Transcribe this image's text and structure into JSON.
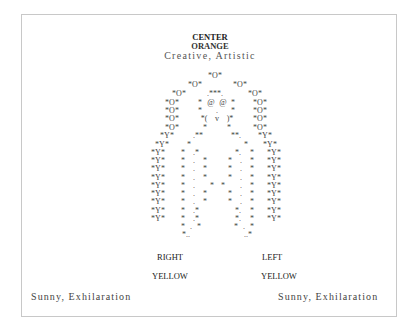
{
  "header": {
    "position": "CENTER",
    "color": "ORANGE",
    "traits": "Creative, Artistic"
  },
  "ascii_art": {
    "description": "Figure drawn in text characters: head ring of *O* tokens, face with @ @ eyes and ( v ) mouth, body and arms ring of *Y* tokens",
    "rows": [
      {
        "y": 72,
        "tokens": [
          {
            "x": 215,
            "t": "*O*"
          }
        ]
      },
      {
        "y": 81,
        "tokens": [
          {
            "x": 195,
            "t": "*O*"
          },
          {
            "x": 240,
            "t": "*O*"
          }
        ]
      },
      {
        "y": 90,
        "tokens": [
          {
            "x": 179,
            "t": "*O*"
          },
          {
            "x": 215,
            "t": ".***."
          },
          {
            "x": 255,
            "t": "*O*"
          }
        ]
      },
      {
        "y": 99,
        "tokens": [
          {
            "x": 172,
            "t": "*O*"
          },
          {
            "x": 200,
            "t": "*"
          },
          {
            "x": 211,
            "t": "@"
          },
          {
            "x": 223,
            "t": "@"
          },
          {
            "x": 233,
            "t": "*"
          },
          {
            "x": 260,
            "t": "*O*"
          }
        ]
      },
      {
        "y": 107,
        "tokens": [
          {
            "x": 172,
            "t": "*O*"
          },
          {
            "x": 200,
            "t": "*"
          },
          {
            "x": 217,
            "t": "."
          },
          {
            "x": 233,
            "t": "*"
          },
          {
            "x": 260,
            "t": "*O*"
          }
        ]
      },
      {
        "y": 115,
        "tokens": [
          {
            "x": 172,
            "t": "*O*"
          },
          {
            "x": 204,
            "t": "*("
          },
          {
            "x": 217,
            "t": "v"
          },
          {
            "x": 230,
            "t": ")*"
          },
          {
            "x": 260,
            "t": "*O*"
          }
        ]
      },
      {
        "y": 124,
        "tokens": [
          {
            "x": 172,
            "t": "*O*"
          },
          {
            "x": 205,
            "t": "*"
          },
          {
            "x": 229,
            "t": "*"
          },
          {
            "x": 260,
            "t": "*O*"
          }
        ]
      },
      {
        "y": 132,
        "tokens": [
          {
            "x": 167,
            "t": "*Y*"
          },
          {
            "x": 198,
            "t": ".**"
          },
          {
            "x": 236,
            "t": "**."
          },
          {
            "x": 265,
            "t": "*Y*"
          }
        ]
      },
      {
        "y": 141,
        "tokens": [
          {
            "x": 162,
            "t": "*Y*"
          },
          {
            "x": 189,
            "t": "*"
          },
          {
            "x": 246,
            "t": "*"
          },
          {
            "x": 270,
            "t": "*Y*"
          }
        ]
      },
      {
        "y": 149,
        "tokens": [
          {
            "x": 158,
            "t": "*Y*"
          },
          {
            "x": 183,
            "t": "*"
          },
          {
            "x": 196,
            "t": ".*"
          },
          {
            "x": 238,
            "t": "*."
          },
          {
            "x": 252,
            "t": "*"
          },
          {
            "x": 274,
            "t": "*Y*"
          }
        ]
      },
      {
        "y": 157,
        "tokens": [
          {
            "x": 158,
            "t": "*Y*"
          },
          {
            "x": 183,
            "t": "*"
          },
          {
            "x": 194,
            "t": "."
          },
          {
            "x": 205,
            "t": "*"
          },
          {
            "x": 230,
            "t": "*"
          },
          {
            "x": 241,
            "t": "."
          },
          {
            "x": 252,
            "t": "*"
          },
          {
            "x": 274,
            "t": "*Y*"
          }
        ]
      },
      {
        "y": 165,
        "tokens": [
          {
            "x": 158,
            "t": "*Y*"
          },
          {
            "x": 183,
            "t": "*"
          },
          {
            "x": 194,
            "t": "."
          },
          {
            "x": 205,
            "t": "*"
          },
          {
            "x": 230,
            "t": "*"
          },
          {
            "x": 241,
            "t": "."
          },
          {
            "x": 252,
            "t": "*"
          },
          {
            "x": 274,
            "t": "*Y*"
          }
        ]
      },
      {
        "y": 174,
        "tokens": [
          {
            "x": 158,
            "t": "*Y*"
          },
          {
            "x": 183,
            "t": "*"
          },
          {
            "x": 194,
            "t": "."
          },
          {
            "x": 205,
            "t": "*"
          },
          {
            "x": 230,
            "t": "*"
          },
          {
            "x": 241,
            "t": "."
          },
          {
            "x": 252,
            "t": "*"
          },
          {
            "x": 274,
            "t": "*Y*"
          }
        ]
      },
      {
        "y": 182,
        "tokens": [
          {
            "x": 158,
            "t": "*Y*"
          },
          {
            "x": 183,
            "t": "*"
          },
          {
            "x": 194,
            "t": "."
          },
          {
            "x": 212,
            "t": "*"
          },
          {
            "x": 223,
            "t": "*"
          },
          {
            "x": 241,
            "t": "."
          },
          {
            "x": 252,
            "t": "*"
          },
          {
            "x": 274,
            "t": "*Y*"
          }
        ]
      },
      {
        "y": 190,
        "tokens": [
          {
            "x": 158,
            "t": "*Y*"
          },
          {
            "x": 183,
            "t": "*"
          },
          {
            "x": 194,
            "t": "."
          },
          {
            "x": 205,
            "t": "*"
          },
          {
            "x": 230,
            "t": "*"
          },
          {
            "x": 241,
            "t": "."
          },
          {
            "x": 252,
            "t": "*"
          },
          {
            "x": 274,
            "t": "*Y*"
          }
        ]
      },
      {
        "y": 198,
        "tokens": [
          {
            "x": 158,
            "t": "*Y*"
          },
          {
            "x": 183,
            "t": "*"
          },
          {
            "x": 194,
            "t": "."
          },
          {
            "x": 205,
            "t": "*"
          },
          {
            "x": 230,
            "t": "*"
          },
          {
            "x": 241,
            "t": "."
          },
          {
            "x": 252,
            "t": "*"
          },
          {
            "x": 274,
            "t": "*Y*"
          }
        ]
      },
      {
        "y": 207,
        "tokens": [
          {
            "x": 158,
            "t": "*Y*"
          },
          {
            "x": 183,
            "t": "*"
          },
          {
            "x": 196,
            "t": ".*"
          },
          {
            "x": 238,
            "t": "*."
          },
          {
            "x": 252,
            "t": "*"
          },
          {
            "x": 274,
            "t": "*Y*"
          }
        ]
      },
      {
        "y": 215,
        "tokens": [
          {
            "x": 158,
            "t": "*Y*"
          },
          {
            "x": 183,
            "t": "*"
          },
          {
            "x": 196,
            "t": ".*"
          },
          {
            "x": 238,
            "t": "*."
          },
          {
            "x": 252,
            "t": "*"
          },
          {
            "x": 274,
            "t": "*Y*"
          }
        ]
      },
      {
        "y": 223,
        "tokens": [
          {
            "x": 183,
            "t": "*"
          },
          {
            "x": 191,
            "t": "."
          },
          {
            "x": 199,
            "t": "*"
          },
          {
            "x": 236,
            "t": "*"
          },
          {
            "x": 244,
            "t": "."
          },
          {
            "x": 252,
            "t": "*"
          }
        ]
      },
      {
        "y": 231,
        "tokens": [
          {
            "x": 186,
            "t": "*.."
          },
          {
            "x": 248,
            "t": "..*"
          }
        ]
      }
    ]
  },
  "labels": {
    "right_side": "RIGHT",
    "left_side": "LEFT",
    "right_color": "YELLOW",
    "left_color": "YELLOW",
    "right_traits": "Sunny, Exhilaration",
    "left_traits": "Sunny, Exhilaration"
  }
}
